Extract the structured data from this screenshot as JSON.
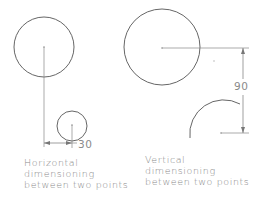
{
  "diagram": {
    "colors": {
      "geometry": "#555555",
      "dimension": "#8a8a8a",
      "text": "#8a8a8a",
      "background": "#ffffff"
    },
    "horizontal_example": {
      "dimension_value": "30",
      "caption_lines": [
        "Horizontal",
        "dimensioning",
        "between two points"
      ]
    },
    "vertical_example": {
      "dimension_value": "90",
      "caption_lines": [
        "Vertical",
        "dimensioning",
        "between two points"
      ]
    }
  }
}
